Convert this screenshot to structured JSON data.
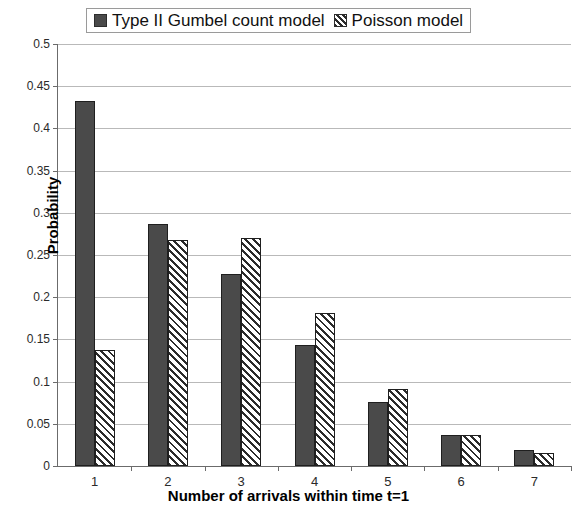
{
  "chart_data": {
    "type": "bar",
    "title": "",
    "xlabel": "Number of arrivals within time t=1",
    "ylabel": "Probability",
    "categories": [
      "1",
      "2",
      "3",
      "4",
      "5",
      "6",
      "7"
    ],
    "series": [
      {
        "name": "Type II Gumbel count model",
        "style": "solid",
        "color": "#4a4a4a",
        "values": [
          0.433,
          0.287,
          0.228,
          0.143,
          0.076,
          0.037,
          0.019
        ]
      },
      {
        "name": "Poisson model",
        "style": "hatched",
        "color": "#2b2b2b",
        "values": [
          0.137,
          0.268,
          0.27,
          0.181,
          0.091,
          0.037,
          0.016
        ]
      }
    ],
    "ylim": [
      0,
      0.5
    ],
    "ytick_values": [
      0,
      0.05,
      0.1,
      0.15,
      0.2,
      0.25,
      0.3,
      0.35,
      0.4,
      0.45,
      0.5
    ],
    "ytick_labels": [
      "0",
      "0.05",
      "0.1",
      "0.15",
      "0.2",
      "0.25",
      "0.3",
      "0.35",
      "0.4",
      "0.45",
      "0.5"
    ],
    "grid": true,
    "grid_axis": "y",
    "legend_position": "top-center"
  },
  "legend": {
    "entries": [
      {
        "label": "Type II Gumbel count model",
        "swatch": "solid-square-icon"
      },
      {
        "label": "Poisson model",
        "swatch": "hatched-square-icon"
      }
    ]
  },
  "axes": {
    "x_title": "Number of arrivals within time t=1",
    "y_title": "Probability"
  }
}
